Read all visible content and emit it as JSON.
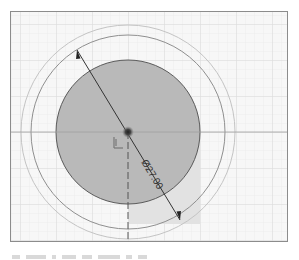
{
  "sketch": {
    "dimension_label": "Ø27.00",
    "center": {
      "x": 127,
      "y": 131
    },
    "circles": {
      "filled_radius": 72,
      "middle_radius": 97,
      "outer_radius": 107
    },
    "colors": {
      "background": "#f7f7f7",
      "grid_minor": "#ececec",
      "grid_major": "#dadada",
      "filled_profile": "#b9b9b9",
      "profile_edge": "#555555",
      "construction_circle": "#9a9a9a",
      "outer_circle": "#c4c4c4",
      "shade_region": "#e2e2e2",
      "dimension_line": "#333333",
      "frame_border": "#8c8c8c"
    },
    "dimension_arrow": {
      "start": {
        "x": 76,
        "y": 49
      },
      "end": {
        "x": 179,
        "y": 219
      }
    },
    "origin_marker": "sketch-origin-icon"
  },
  "caption": {
    "text_visible": false
  }
}
